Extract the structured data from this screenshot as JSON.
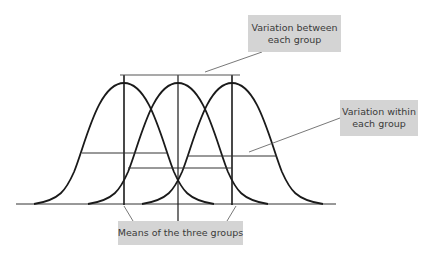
{
  "labels": {
    "between": {
      "line1": "Variation between",
      "line2": "each group"
    },
    "within": {
      "line1": "Variation within",
      "line2": "each group"
    },
    "means": {
      "line1": "Means of the three groups"
    }
  },
  "colors": {
    "curve": "#1a1a1a",
    "label_bg": "#d4d4d4",
    "label_text": "#3a3a3a",
    "line": "#333333"
  },
  "groups": [
    {
      "name": "Group 1",
      "mean_x": 124
    },
    {
      "name": "Group 2",
      "mean_x": 178
    },
    {
      "name": "Group 3",
      "mean_x": 232
    }
  ]
}
